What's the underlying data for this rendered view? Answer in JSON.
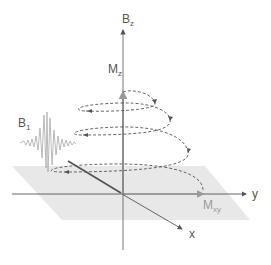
{
  "diagram": {
    "labels": {
      "bz": "B",
      "bz_sub": "z",
      "mz": "M",
      "mz_sub": "z",
      "b1": "B",
      "b1_sub": "1",
      "mxy": "M",
      "mxy_sub": "xy",
      "y_axis": "y",
      "x_axis": "x"
    },
    "colors": {
      "axis": "#555555",
      "plane": "#e6e6e6",
      "helix": "#555555",
      "pulse": "#a8a8a8",
      "mxy_label": "#9a9a9a"
    }
  }
}
